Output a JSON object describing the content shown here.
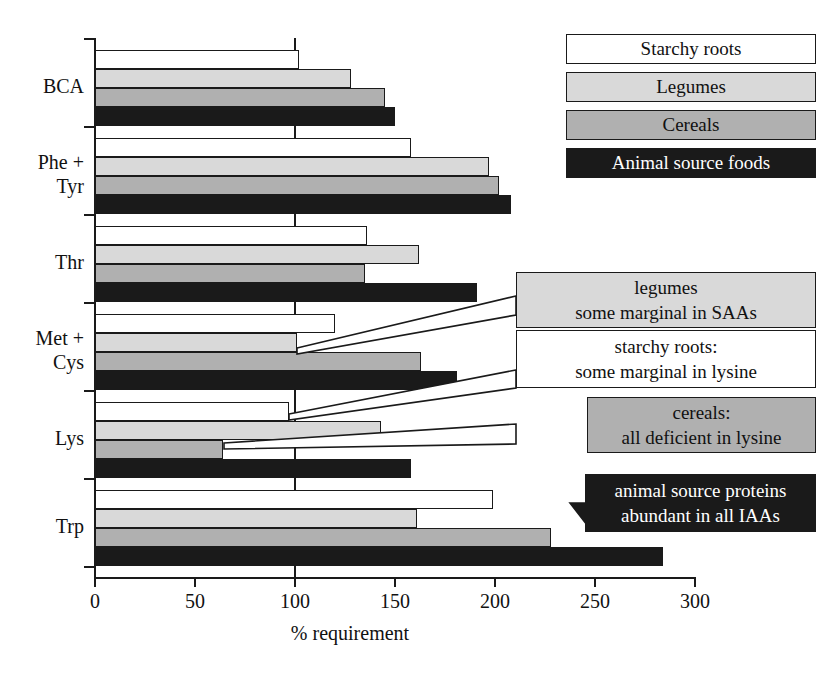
{
  "chart_data": {
    "type": "bar",
    "orientation": "horizontal",
    "title": "",
    "xlabel": "% requirement",
    "ylabel": "",
    "xlim": [
      0,
      300
    ],
    "xticks": [
      0,
      50,
      100,
      150,
      200,
      250,
      300
    ],
    "xtick_labels": [
      "0",
      "50",
      "100",
      "150",
      "200",
      "250",
      "300"
    ],
    "grid": false,
    "reference_line": 100,
    "legend_position": "top-right",
    "categories": [
      "BCA",
      "Phe + Tyr",
      "Thr",
      "Met + Cys",
      "Lys",
      "Trp"
    ],
    "series": [
      {
        "name": "Starchy roots",
        "color": "#ffffff",
        "values": [
          102,
          158,
          136,
          120,
          97,
          199
        ]
      },
      {
        "name": "Legumes",
        "color": "#d9d9d9",
        "values": [
          128,
          197,
          162,
          101,
          143,
          161
        ]
      },
      {
        "name": "Cereals",
        "color": "#b0b0b0",
        "values": [
          145,
          202,
          135,
          163,
          64,
          228
        ]
      },
      {
        "name": "Animal source foods",
        "color": "#1a1a1a",
        "values": [
          150,
          208,
          191,
          181,
          158,
          284
        ]
      }
    ],
    "annotations": [
      {
        "id": "legumes-saa",
        "lines": [
          "legumes",
          "some marginal in SAAs"
        ],
        "style": "s1"
      },
      {
        "id": "starchy-lysine",
        "lines": [
          "starchy roots:",
          "some marginal in lysine"
        ],
        "style": "s0"
      },
      {
        "id": "cereals-lysine",
        "lines": [
          "cereals:",
          "all deficient in lysine"
        ],
        "style": "s2"
      },
      {
        "id": "animal-iaa",
        "lines": [
          "animal source proteins",
          "abundant in all IAAs"
        ],
        "style": "s3"
      }
    ]
  },
  "legend": {
    "items": [
      {
        "label": "Starchy roots",
        "style": "s0"
      },
      {
        "label": "Legumes",
        "style": "s1"
      },
      {
        "label": "Cereals",
        "style": "s2"
      },
      {
        "label": "Animal source foods",
        "style": "s3"
      }
    ]
  },
  "colors": {
    "starchy_roots": "#ffffff",
    "legumes": "#d9d9d9",
    "cereals": "#b0b0b0",
    "animal_source_foods": "#1a1a1a",
    "axis": "#1a1a1a",
    "background": "#ffffff"
  }
}
